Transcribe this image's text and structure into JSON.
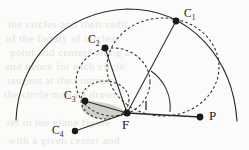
{
  "figure": {
    "type": "geometry-diagram",
    "background_color": "#fbfbf9",
    "stroke_color": "#2b2b2b",
    "shaded_region_color": "#c9c9c4",
    "bleed_text_color": "#e7e5df",
    "labels": {
      "c1": "C",
      "c1_sub": "1",
      "c2": "C",
      "c2_sub": "2",
      "c3": "C",
      "c3_sub": "3",
      "c4": "C",
      "c4_sub": "4",
      "f": "F",
      "p": "P"
    },
    "points": [
      {
        "name": "C1",
        "x": 176,
        "y": 21
      },
      {
        "name": "C2",
        "x": 105,
        "y": 48
      },
      {
        "name": "C3",
        "x": 85,
        "y": 101
      },
      {
        "name": "C4",
        "x": 75,
        "y": 131
      },
      {
        "name": "F",
        "x": 127,
        "y": 113
      },
      {
        "name": "P",
        "x": 200,
        "y": 117
      }
    ],
    "bleed_lines": [
      "the  circles  and  their  radii",
      "of  the  family  of  circles",
      "point  and  centers  along  a",
      "and  hence  for  each  circle",
      "tangent  at  the  common",
      "the  circle  may  be  drawn",
      "set  in  the  plane  figure",
      "with  a  given  center  and"
    ]
  }
}
